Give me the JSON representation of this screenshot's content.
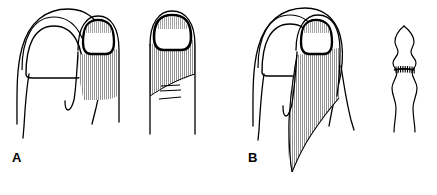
{
  "figure": {
    "kind": "line-drawing",
    "caption_visible": false,
    "background_color": "#ffffff",
    "ink_color": "#000000",
    "hatch_color": "#7a7a7a",
    "width": 437,
    "height": 195,
    "panels": [
      {
        "id": "A",
        "label": "A",
        "label_x": 12,
        "label_y": 162,
        "items": [
          {
            "name": "great-toe-outline",
            "description": "great toe with plain nail outline, no shading"
          },
          {
            "name": "second-toe-shaded",
            "description": "second toe with dark nail border and vertical hatch shading over distal pulp"
          },
          {
            "name": "enlarged-toe-detail",
            "description": "enlarged digit with dark nail border, hatched proximal area and three short transverse skin crease lines"
          }
        ],
        "crease_line_count": 3
      },
      {
        "id": "B",
        "label": "B",
        "label_x": 248,
        "label_y": 162,
        "items": [
          {
            "name": "great-toe-outline",
            "description": "great toe with plain nail outline, no shading"
          },
          {
            "name": "second-toe-long-flap",
            "description": "second toe with dark nail border and long tapering hatched flap extending proximally"
          },
          {
            "name": "sutured-digit-detail",
            "description": "narrow digit in profile with transverse sutured incision line and stitch marks"
          }
        ],
        "suture_tick_count": 9
      }
    ]
  }
}
